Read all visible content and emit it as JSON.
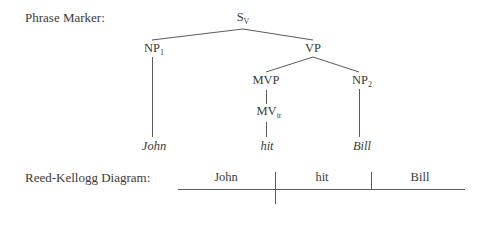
{
  "phrase_marker": {
    "label": "Phrase Marker:",
    "nodes": {
      "s": {
        "base": "S",
        "sub": "V"
      },
      "np1": {
        "base": "NP",
        "sub": "1"
      },
      "vp": {
        "base": "VP",
        "sub": ""
      },
      "mvp": {
        "base": "MVP",
        "sub": ""
      },
      "mv": {
        "base": "MV",
        "sub": "tr"
      },
      "np2": {
        "base": "NP",
        "sub": "2"
      }
    },
    "leaves": {
      "john": "John",
      "hit": "hit",
      "bill": "Bill"
    }
  },
  "reed_kellogg": {
    "label": "Reed-Kellogg Diagram:",
    "subject": "John",
    "verb": "hit",
    "object": "Bill"
  }
}
